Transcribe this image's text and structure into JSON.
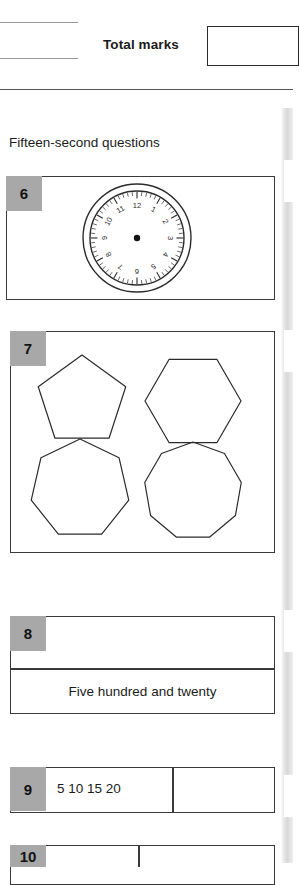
{
  "header": {
    "total_marks_label": "Total marks",
    "total_marks_value": ""
  },
  "section": {
    "title": "Fifteen-second questions"
  },
  "questions": [
    {
      "number": "6",
      "type": "clock-face",
      "clock": {
        "numerals": [
          "12",
          "1",
          "2",
          "3",
          "4",
          "5",
          "6",
          "7",
          "8",
          "9",
          "10",
          "11"
        ],
        "has_hands": false,
        "has_center_dot": true,
        "minute_ticks": 60
      },
      "answer": ""
    },
    {
      "number": "7",
      "type": "shapes",
      "shapes": [
        {
          "name": "pentagon",
          "sides": 5
        },
        {
          "name": "hexagon",
          "sides": 6
        },
        {
          "name": "heptagon",
          "sides": 7
        },
        {
          "name": "nonagon",
          "sides": 9
        }
      ],
      "answer": ""
    },
    {
      "number": "8",
      "type": "written-number",
      "answer": "",
      "prompt_text": "Five hundred and twenty"
    },
    {
      "number": "9",
      "type": "sequence",
      "sequence": "5  10  15  20",
      "answer": ""
    },
    {
      "number": "10",
      "type": "partial",
      "answer": ""
    }
  ],
  "colors": {
    "number_box": "#a8a8a8",
    "border": "#3a3a3a",
    "text": "#1b1b1b",
    "page_edge": "#d8d8d8"
  }
}
